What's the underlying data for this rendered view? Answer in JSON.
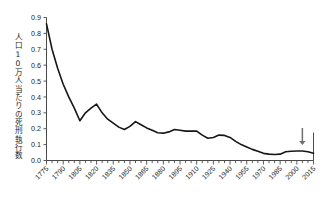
{
  "chart_data": {
    "type": "line",
    "title": "",
    "xlabel": "",
    "ylabel": "人口10万人当たりの死刑執行数",
    "ylim": [
      0.0,
      0.9
    ],
    "xlim": [
      1775,
      2015
    ],
    "grid": false,
    "legend": "none",
    "ytick_labels": [
      "0.9",
      "0.8",
      "0.7",
      "0.6",
      "0.5",
      "0.4",
      "0.3",
      "0.2",
      "0.1",
      "0.0"
    ],
    "ytick_values": [
      0.9,
      0.8,
      0.7,
      0.6,
      0.5,
      0.4,
      0.3,
      0.2,
      0.1,
      0.0
    ],
    "xtick_labels": [
      "1775",
      "1790",
      "1805",
      "1820",
      "1835",
      "1850",
      "1865",
      "1880",
      "1895",
      "1910",
      "1925",
      "1940",
      "1955",
      "1970",
      "1985",
      "2000",
      "2015"
    ],
    "xtick_values": [
      1775,
      1790,
      1805,
      1820,
      1835,
      1850,
      1865,
      1880,
      1895,
      1910,
      1925,
      1940,
      1955,
      1970,
      1985,
      2000,
      2015
    ],
    "minor_xtick_step": 5,
    "x": [
      1775,
      1780,
      1785,
      1790,
      1795,
      1800,
      1805,
      1810,
      1815,
      1820,
      1825,
      1830,
      1835,
      1840,
      1845,
      1850,
      1855,
      1860,
      1865,
      1870,
      1875,
      1880,
      1885,
      1890,
      1895,
      1900,
      1905,
      1910,
      1915,
      1920,
      1925,
      1930,
      1935,
      1940,
      1945,
      1950,
      1955,
      1960,
      1965,
      1970,
      1975,
      1980,
      1985,
      1990,
      1995,
      2000,
      2005,
      2010,
      2015
    ],
    "values": [
      0.86,
      0.7,
      0.58,
      0.48,
      0.4,
      0.33,
      0.25,
      0.3,
      0.33,
      0.355,
      0.3,
      0.26,
      0.235,
      0.21,
      0.195,
      0.215,
      0.245,
      0.225,
      0.205,
      0.19,
      0.175,
      0.172,
      0.18,
      0.195,
      0.19,
      0.185,
      0.185,
      0.185,
      0.16,
      0.14,
      0.145,
      0.16,
      0.158,
      0.145,
      0.12,
      0.1,
      0.085,
      0.07,
      0.058,
      0.045,
      0.04,
      0.038,
      0.04,
      0.055,
      0.058,
      0.06,
      0.06,
      0.055,
      0.045
    ],
    "series_name": "死刑執行数",
    "annotations": [
      {
        "name": "down-arrow",
        "x": 2005,
        "label": "",
        "points_to": 0.06
      }
    ],
    "line_color": "#161616",
    "axis_color": "#4a4a4a",
    "arrow_color": "#6f6f6f",
    "background": "#ffffff"
  }
}
